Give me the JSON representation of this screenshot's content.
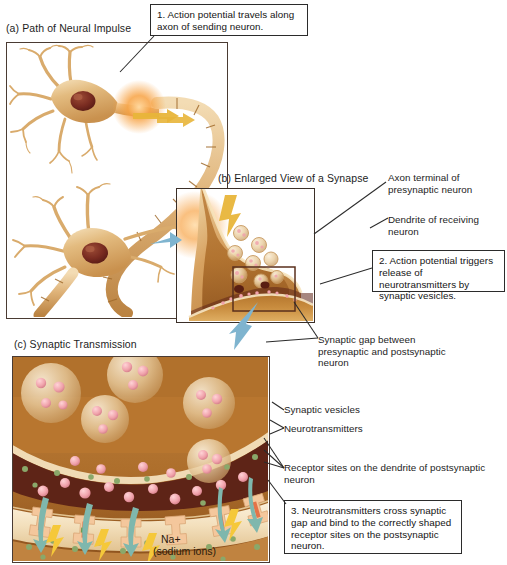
{
  "figure": {
    "title": "Synaptic Transmission",
    "panels": [
      {
        "id": "a",
        "title": "(a) Path of Neural Impulse"
      },
      {
        "id": "b",
        "title": "(b) Enlarged View of a Synapse"
      },
      {
        "id": "c",
        "title": "(c) Synaptic Transmission"
      }
    ]
  },
  "callouts": [
    {
      "number": "1",
      "text": "1. Action potential travels along axon of sending neuron."
    },
    {
      "number": "2",
      "text": "2. Action potential triggers release of neurotransmitters by synaptic vesicles."
    },
    {
      "number": "3",
      "text": "3. Neurotransmitters cross synaptic gap and bind to the correctly shaped receptor sites on the postsynaptic neuron."
    }
  ],
  "labels": {
    "axon_terminal": "Axon terminal of presynaptic neuron",
    "dendrite": "Dendrite of receiving neuron",
    "synaptic_gap": "Synaptic gap between presynaptic and postsynaptic neuron",
    "synaptic_vesicles": "Synaptic vesicles",
    "neurotransmitters": "Neurotransmitters",
    "receptor_sites": "Receptor sites on the dendrite of postsynaptic neuron",
    "sodium_line1": "Na+",
    "sodium_line2": "(sodium ions)"
  },
  "colors": {
    "neuron_body": "#d8a86a",
    "neuron_highlight": "#f2d9a8",
    "nucleus": "#7e2f24",
    "impulse_glow": "#f7a243",
    "impulse_arrow": "#e8b53a",
    "zoom_arrow": "#7fb4cf",
    "background_terminal": "#b8762f",
    "background_cleft": "#5e2417",
    "vesicle": "#e8c79a",
    "neurotransmitter": "#f2a8b0",
    "receptor": "#f4c79c",
    "sodium_ion": "#8aa86a",
    "ion_arrow": "#7fb7ad",
    "lightning": "#f5c83a",
    "frame_border": "#4a3b33",
    "text": "#1d1d1d"
  }
}
